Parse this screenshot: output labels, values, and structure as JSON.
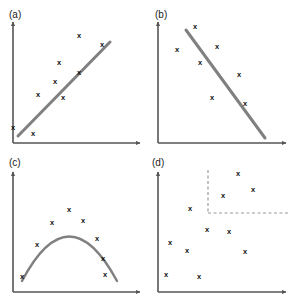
{
  "figure": {
    "width": 291,
    "height": 299,
    "background": "#ffffff",
    "colors": {
      "axis": "#555555",
      "marker": "#111111",
      "trend_line": "#808080",
      "dashed_guide": "#9a9a9a",
      "label_text": "#222222"
    },
    "marker_glyph": "x",
    "panels": [
      {
        "id": "a",
        "label": "(a)",
        "label_pos": {
          "x": 9,
          "y": 18
        },
        "axes": {
          "x0": 13,
          "y0": 143,
          "x1": 140,
          "y1": 22
        },
        "trend": {
          "type": "line",
          "x1": 18,
          "y1": 136,
          "x2": 110,
          "y2": 42
        },
        "points": [
          {
            "x": 13,
            "y": 127
          },
          {
            "x": 33,
            "y": 133
          },
          {
            "x": 38,
            "y": 94
          },
          {
            "x": 55,
            "y": 81
          },
          {
            "x": 59,
            "y": 62
          },
          {
            "x": 63,
            "y": 97
          },
          {
            "x": 79,
            "y": 72
          },
          {
            "x": 79,
            "y": 35
          },
          {
            "x": 102,
            "y": 44
          }
        ]
      },
      {
        "id": "b",
        "label": "(b)",
        "label_pos": {
          "x": 155,
          "y": 18
        },
        "axes": {
          "x0": 158,
          "y0": 143,
          "x1": 286,
          "y1": 22
        },
        "trend": {
          "type": "line",
          "x1": 186,
          "y1": 30,
          "x2": 265,
          "y2": 138
        },
        "points": [
          {
            "x": 195,
            "y": 26
          },
          {
            "x": 177,
            "y": 49
          },
          {
            "x": 217,
            "y": 46
          },
          {
            "x": 200,
            "y": 62
          },
          {
            "x": 239,
            "y": 74
          },
          {
            "x": 212,
            "y": 97
          },
          {
            "x": 245,
            "y": 103
          }
        ]
      },
      {
        "id": "c",
        "label": "(c)",
        "label_pos": {
          "x": 9,
          "y": 166
        },
        "axes": {
          "x0": 13,
          "y0": 292,
          "x1": 140,
          "y1": 172
        },
        "trend": {
          "type": "parabola",
          "path": "M 22 281 Q 69 192 117 281"
        },
        "points": [
          {
            "x": 22,
            "y": 276
          },
          {
            "x": 37,
            "y": 244
          },
          {
            "x": 52,
            "y": 222
          },
          {
            "x": 69,
            "y": 209
          },
          {
            "x": 83,
            "y": 220
          },
          {
            "x": 97,
            "y": 238
          },
          {
            "x": 103,
            "y": 258
          },
          {
            "x": 105,
            "y": 274
          }
        ]
      },
      {
        "id": "d",
        "label": "(d)",
        "label_pos": {
          "x": 152,
          "y": 166
        },
        "axes": {
          "x0": 158,
          "y0": 292,
          "x1": 286,
          "y1": 172
        },
        "guides": [
          {
            "orientation": "vertical",
            "x": 208,
            "y1": 170,
            "y2": 213
          },
          {
            "orientation": "horizontal",
            "y": 213,
            "x1": 208,
            "x2": 288
          }
        ],
        "points": [
          {
            "x": 238,
            "y": 173
          },
          {
            "x": 253,
            "y": 189
          },
          {
            "x": 223,
            "y": 195
          },
          {
            "x": 190,
            "y": 208
          },
          {
            "x": 207,
            "y": 229
          },
          {
            "x": 229,
            "y": 231
          },
          {
            "x": 170,
            "y": 242
          },
          {
            "x": 187,
            "y": 250
          },
          {
            "x": 245,
            "y": 251
          },
          {
            "x": 166,
            "y": 274
          },
          {
            "x": 199,
            "y": 276
          }
        ]
      }
    ]
  },
  "chart_data": {
    "type": "scatter",
    "title": "",
    "xlabel": "",
    "ylabel": "",
    "grid": false,
    "legend": null,
    "panel_count": 4,
    "panels": [
      {
        "id": "a",
        "label": "(a)",
        "description": "strong positive linear association with fitted straight line",
        "trend": "positive-linear",
        "x": [
          0.02,
          0.17,
          0.21,
          0.35,
          0.38,
          0.42,
          0.56,
          0.56,
          0.75
        ],
        "y": [
          0.14,
          0.09,
          0.42,
          0.53,
          0.69,
          0.39,
          0.6,
          0.91,
          0.83
        ],
        "xlim": [
          0,
          1
        ],
        "ylim": [
          0,
          1
        ]
      },
      {
        "id": "b",
        "label": "(b)",
        "description": "negative linear association with fitted straight line",
        "trend": "negative-linear",
        "x": [
          0.3,
          0.16,
          0.47,
          0.34,
          0.64,
          0.43,
          0.69
        ],
        "y": [
          0.97,
          0.78,
          0.81,
          0.67,
          0.57,
          0.39,
          0.34
        ],
        "xlim": [
          0,
          1
        ],
        "ylim": [
          0,
          1
        ]
      },
      {
        "id": "c",
        "label": "(c)",
        "description": "non-linear curvilinear association, inverted-U quadratic curve",
        "trend": "quadratic-concave-down",
        "x": [
          0.07,
          0.19,
          0.31,
          0.45,
          0.56,
          0.67,
          0.72,
          0.74
        ],
        "y": [
          0.13,
          0.4,
          0.59,
          0.7,
          0.6,
          0.45,
          0.28,
          0.15
        ],
        "xlim": [
          0,
          1
        ],
        "ylim": [
          0,
          1
        ]
      },
      {
        "id": "d",
        "label": "(d)",
        "description": "no association, random scatter with dashed quadrant guide lines",
        "trend": "none",
        "x": [
          0.63,
          0.74,
          0.51,
          0.25,
          0.39,
          0.55,
          0.09,
          0.23,
          0.68,
          0.06,
          0.32
        ],
        "y": [
          0.99,
          0.86,
          0.81,
          0.7,
          0.53,
          0.51,
          0.42,
          0.35,
          0.34,
          0.15,
          0.13
        ],
        "guide_x": 0.39,
        "guide_y": 0.66,
        "xlim": [
          0,
          1
        ],
        "ylim": [
          0,
          1
        ]
      }
    ]
  }
}
